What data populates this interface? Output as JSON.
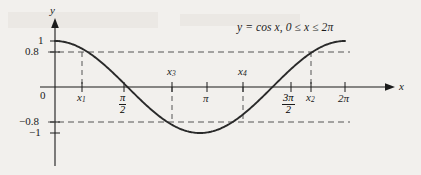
{
  "figure": {
    "equation_label": {
      "full": "y = cos x, 0 ≤ x ≤ 2π",
      "lhs": "y",
      "equals": "= cos",
      "var": "x",
      "domain": ", 0 ≤ x ≤ 2π"
    },
    "axis_names": {
      "x": "x",
      "y": "y"
    },
    "origin_label": "0",
    "y_tick_labels": [
      "1",
      "0.8",
      "−0.8",
      "−1"
    ],
    "x_tick_labels": {
      "pi_over_2_num": "π",
      "pi_over_2_den": "2",
      "pi": "π",
      "three_pi_over_2_num": "3π",
      "three_pi_over_2_den": "2",
      "two_pi": "2π"
    },
    "point_labels": {
      "x1": "x",
      "x1_sub": "1",
      "x2": "x",
      "x2_sub": "2",
      "x3": "x",
      "x3_sub": "3",
      "x4": "x",
      "x4_sub": "4"
    },
    "colors": {
      "background": "#f2f0ed",
      "ink": "#1b1b1b",
      "curve": "#2a2a2a",
      "dashed": "#555555"
    }
  },
  "chart_data": {
    "type": "line",
    "title": "",
    "function": "y = cos x",
    "domain_text": "0 ≤ x ≤ 2π",
    "xlabel": "x",
    "ylabel": "y",
    "xlim": [
      0,
      6.283185
    ],
    "ylim": [
      -1,
      1
    ],
    "grid": false,
    "legend": "none",
    "x_ticks": [
      0,
      1.5707963,
      3.1415927,
      4.712389,
      6.283185
    ],
    "x_tick_labels": [
      "0",
      "π/2",
      "π",
      "3π/2",
      "2π"
    ],
    "y_ticks": [
      -1,
      -0.8,
      0,
      0.8,
      1
    ],
    "y_tick_labels": [
      "−1",
      "−0.8",
      "0",
      "0.8",
      "1"
    ],
    "reference_lines": [
      {
        "type": "horizontal",
        "value": 0.8,
        "style": "dashed"
      },
      {
        "type": "horizontal",
        "value": -0.8,
        "style": "dashed"
      }
    ],
    "marked_points": [
      {
        "name": "x1",
        "x": 0.6435,
        "y": 0.8,
        "note": "cos x = 0.8, first solution"
      },
      {
        "name": "x2",
        "x": 5.6397,
        "y": 0.8,
        "note": "cos x = 0.8, second solution"
      },
      {
        "name": "x3",
        "x": 2.4981,
        "y": -0.8,
        "note": "cos x = -0.8, first solution"
      },
      {
        "name": "x4",
        "x": 3.7851,
        "y": -0.8,
        "note": "cos x = -0.8, second solution"
      }
    ],
    "series": [
      {
        "name": "y = cos x",
        "x": [
          0,
          0.3142,
          0.6283,
          0.9425,
          1.2566,
          1.5708,
          1.885,
          2.1991,
          2.5133,
          2.8274,
          3.1416,
          3.4558,
          3.7699,
          4.0841,
          4.3982,
          4.7124,
          5.0265,
          5.3407,
          5.6549,
          5.969,
          6.2832
        ],
        "values": [
          1,
          0.951,
          0.809,
          0.588,
          0.309,
          0,
          -0.309,
          -0.588,
          -0.809,
          -0.951,
          -1,
          -0.951,
          -0.809,
          -0.588,
          -0.309,
          0,
          0.309,
          0.588,
          0.809,
          0.951,
          1
        ]
      }
    ]
  }
}
